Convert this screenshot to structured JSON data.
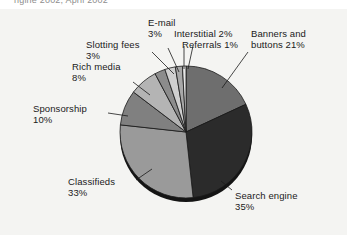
{
  "figure": {
    "title_partial": "ngine 2002, April 2002",
    "background_color": "#f4f4f2",
    "page_color": "#ffffff"
  },
  "chart_data": {
    "type": "pie",
    "title": "ngine 2002, April 2002",
    "xlabel": "",
    "ylabel": "",
    "legend_position": "none",
    "labels_inline": true,
    "grid": false,
    "start_angle_deg": 0,
    "direction": "clockwise",
    "categories": [
      "Banners and buttons",
      "Search engine",
      "Classifieds",
      "Sponsorship",
      "Rich media",
      "Slotting fees",
      "E-mail",
      "Interstitial",
      "Referrals"
    ],
    "values": [
      21,
      35,
      33,
      10,
      8,
      3,
      3,
      2,
      1
    ],
    "value_suffix": "%",
    "colors": [
      "#6e6e6e",
      "#2b2b2b",
      "#9a9a9a",
      "#808080",
      "#b4b4b4",
      "#8c8c8c",
      "#cfcfcf",
      "#a8a8a8",
      "#e6e6e6"
    ],
    "slice_edge_color": "#1a1a1a",
    "shadow_color": "#141414"
  },
  "labels": [
    {
      "name": "email",
      "text": "E-mail",
      "pct": "3%"
    },
    {
      "name": "interstitial",
      "text": "Interstitial 2%",
      "pct": ""
    },
    {
      "name": "referrals",
      "text": "Referrals 1%",
      "pct": ""
    },
    {
      "name": "banners",
      "text": "Banners and",
      "pct": "buttons 21%"
    },
    {
      "name": "slotting",
      "text": "Slotting fees",
      "pct": "3%"
    },
    {
      "name": "richmedia",
      "text": "Rich media",
      "pct": "8%"
    },
    {
      "name": "sponsorship",
      "text": "Sponsorship",
      "pct": "10%"
    },
    {
      "name": "classifieds",
      "text": "Classifieds",
      "pct": "33%"
    },
    {
      "name": "searchengine",
      "text": "Search engine",
      "pct": "35%"
    }
  ]
}
